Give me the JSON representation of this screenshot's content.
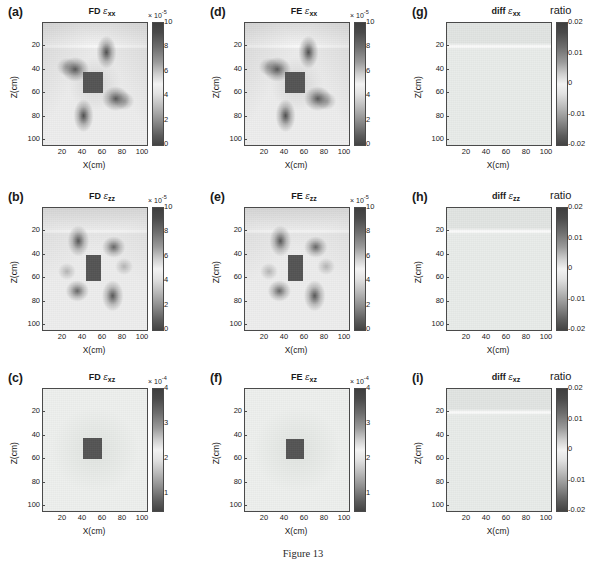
{
  "figure": {
    "caption": "Figure 13",
    "axis": {
      "xlabel": "X(cm)",
      "ylabel": "Z(cm)",
      "xticks": [
        "20",
        "40",
        "60",
        "80",
        "100"
      ],
      "yticks": [
        "20",
        "40",
        "60",
        "80",
        "100"
      ],
      "xlim": [
        0,
        104
      ],
      "ylim": [
        0,
        104
      ]
    }
  },
  "chart_data": {
    "type": "heatmap",
    "title": "Figure 13",
    "xlabel": "X(cm)",
    "ylabel": "Z(cm)",
    "xlim": [
      0,
      104
    ],
    "ylim": [
      104,
      0
    ],
    "xticks": [
      20,
      40,
      60,
      80,
      100
    ],
    "yticks": [
      20,
      40,
      60,
      80,
      100
    ],
    "grid": false,
    "legend": "colorbar-right",
    "colormap": "gray-reversed-diverging",
    "layout": {
      "rows": 3,
      "cols": 3
    },
    "panels": [
      {
        "tag": "(a)",
        "method": "FD",
        "component": "xx",
        "title_prefix": "FD",
        "title_symbol": "ε",
        "title_sub": "xx",
        "cbar_label": "",
        "cbar_multiplier": "× 10",
        "cbar_exponent": "-5",
        "cbar_ticks": [
          "10",
          "8",
          "6",
          "4",
          "2",
          "0"
        ],
        "cbar_values": [
          10,
          8,
          6,
          4,
          2,
          0
        ],
        "clim": [
          0,
          10
        ],
        "inclusion": {
          "x0": 40,
          "x1": 60,
          "z0": 42,
          "z1": 60,
          "value": 9.2
        },
        "interface_depth": 20,
        "pattern": "four-lobe-horizontal",
        "background_value": 4.4
      },
      {
        "tag": "(b)",
        "method": "FD",
        "component": "zz",
        "title_prefix": "FD",
        "title_symbol": "ε",
        "title_sub": "zz",
        "cbar_label": "",
        "cbar_multiplier": "× 10",
        "cbar_exponent": "-5",
        "cbar_ticks": [
          "10",
          "8",
          "6",
          "4",
          "2",
          "0"
        ],
        "cbar_values": [
          10,
          8,
          6,
          4,
          2,
          0
        ],
        "clim": [
          0,
          10
        ],
        "inclusion": {
          "x0": 43,
          "x1": 58,
          "z0": 40,
          "z1": 62,
          "value": 9.0
        },
        "interface_depth": 20,
        "pattern": "four-lobe-diagonal",
        "background_value": 4.6
      },
      {
        "tag": "(c)",
        "method": "FD",
        "component": "xz",
        "title_prefix": "FD",
        "title_symbol": "ε",
        "title_sub": "xz",
        "cbar_label": "",
        "cbar_multiplier": "× 10",
        "cbar_exponent": "-4",
        "cbar_ticks": [
          "4",
          "3",
          "2",
          "1"
        ],
        "cbar_values": [
          4,
          3,
          2,
          1
        ],
        "clim": [
          0.5,
          4
        ],
        "inclusion": {
          "x0": 40,
          "x1": 59,
          "z0": 42,
          "z1": 60,
          "value": 3.6
        },
        "interface_depth": 20,
        "pattern": "flat",
        "background_value": 1.9
      },
      {
        "tag": "(d)",
        "method": "FE",
        "component": "xx",
        "title_prefix": "FE",
        "title_symbol": "ε",
        "title_sub": "xx",
        "cbar_label": "",
        "cbar_multiplier": "× 10",
        "cbar_exponent": "-5",
        "cbar_ticks": [
          "10",
          "8",
          "6",
          "4",
          "2",
          "0"
        ],
        "cbar_values": [
          10,
          8,
          6,
          4,
          2,
          0
        ],
        "clim": [
          0,
          10
        ],
        "inclusion": {
          "x0": 40,
          "x1": 60,
          "z0": 42,
          "z1": 60,
          "value": 9.2
        },
        "interface_depth": 20,
        "pattern": "four-lobe-horizontal",
        "background_value": 4.4
      },
      {
        "tag": "(e)",
        "method": "FE",
        "component": "zz",
        "title_prefix": "FE",
        "title_symbol": "ε",
        "title_sub": "zz",
        "cbar_label": "",
        "cbar_multiplier": "× 10",
        "cbar_exponent": "-5",
        "cbar_ticks": [
          "10",
          "8",
          "6",
          "4",
          "2",
          "0"
        ],
        "cbar_values": [
          10,
          8,
          6,
          4,
          2,
          0
        ],
        "clim": [
          0,
          10
        ],
        "inclusion": {
          "x0": 43,
          "x1": 58,
          "z0": 40,
          "z1": 62,
          "value": 9.0
        },
        "interface_depth": 20,
        "pattern": "four-lobe-diagonal",
        "background_value": 4.6
      },
      {
        "tag": "(f)",
        "method": "FE",
        "component": "xz",
        "title_prefix": "FE",
        "title_symbol": "ε",
        "title_sub": "xz",
        "cbar_label": "",
        "cbar_multiplier": "× 10",
        "cbar_exponent": "-4",
        "cbar_ticks": [
          "4",
          "3",
          "2",
          "1"
        ],
        "cbar_values": [
          4,
          3,
          2,
          1
        ],
        "clim": [
          0.5,
          4
        ],
        "inclusion": {
          "x0": 41,
          "x1": 59,
          "z0": 43,
          "z1": 60,
          "value": 3.6
        },
        "interface_depth": 20,
        "pattern": "flat",
        "background_value": 1.9
      },
      {
        "tag": "(g)",
        "method": "diff",
        "component": "xx",
        "title_prefix": "diff",
        "title_symbol": "ε",
        "title_sub": "xx",
        "cbar_label": "ratio",
        "cbar_multiplier": "",
        "cbar_exponent": "",
        "cbar_ticks": [
          "0.02",
          "0.01",
          "0",
          "-0.01",
          "-0.02"
        ],
        "cbar_values": [
          0.02,
          0.01,
          0,
          -0.01,
          -0.02
        ],
        "clim": [
          -0.02,
          0.02
        ],
        "inclusion": null,
        "interface_depth": 20,
        "pattern": "near-zero",
        "background_value": 0.001
      },
      {
        "tag": "(h)",
        "method": "diff",
        "component": "zz",
        "title_prefix": "diff",
        "title_symbol": "ε",
        "title_sub": "zz",
        "cbar_label": "ratio",
        "cbar_multiplier": "",
        "cbar_exponent": "",
        "cbar_ticks": [
          "0.02",
          "0.01",
          "0",
          "-0.01",
          "-0.02"
        ],
        "cbar_values": [
          0.02,
          0.01,
          0,
          -0.01,
          -0.02
        ],
        "clim": [
          -0.02,
          0.02
        ],
        "inclusion": null,
        "interface_depth": 20,
        "pattern": "near-zero",
        "background_value": 0.001
      },
      {
        "tag": "(i)",
        "method": "diff",
        "component": "xz",
        "title_prefix": "diff",
        "title_symbol": "ε",
        "title_sub": "xz",
        "cbar_label": "ratio",
        "cbar_multiplier": "",
        "cbar_exponent": "",
        "cbar_ticks": [
          "0.02",
          "0.01",
          "0",
          "-0.01",
          "-0.02"
        ],
        "cbar_values": [
          0.02,
          0.01,
          0,
          -0.01,
          -0.02
        ],
        "clim": [
          -0.02,
          0.02
        ],
        "inclusion": null,
        "interface_depth": 20,
        "pattern": "near-zero",
        "background_value": 0.001
      }
    ]
  }
}
